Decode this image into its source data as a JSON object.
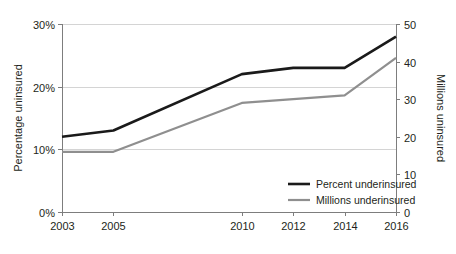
{
  "chart_data": {
    "type": "line",
    "title": "",
    "subtitle": "",
    "xlabel": "",
    "ylabel": "Percentage uninsured",
    "y2label": "Millions uninsured",
    "x": [
      2003,
      2005,
      2010,
      2012,
      2014,
      2016
    ],
    "categories": [
      "2003",
      "2005",
      "2010",
      "2012",
      "2014",
      "2016"
    ],
    "xlim": [
      2003,
      2016
    ],
    "ylim": [
      0,
      30
    ],
    "y2lim": [
      0,
      50
    ],
    "yticks": [
      0,
      10,
      20,
      30
    ],
    "ytick_labels": [
      "0%",
      "10%",
      "20%",
      "30%"
    ],
    "y2ticks": [
      0,
      10,
      20,
      30,
      40,
      50
    ],
    "y2tick_labels": [
      "0",
      "10",
      "20",
      "30",
      "40",
      "50"
    ],
    "grid": "horizontal",
    "legend_position": "inside-bottom-right",
    "series": [
      {
        "name": "Percent underinsured",
        "axis": "left",
        "unit": "%",
        "color": "#1a1a1a",
        "width": 2.6,
        "values": [
          12,
          13,
          22,
          23,
          23,
          28
        ]
      },
      {
        "name": "Millions underinsured",
        "axis": "right",
        "unit": "millions",
        "color": "#8f8f8f",
        "width": 2.2,
        "values": [
          16,
          16,
          29,
          30,
          31,
          41
        ]
      }
    ],
    "annotations": []
  },
  "legend": {
    "items": [
      {
        "label": "Percent underinsured",
        "swatch": "thick-black-line"
      },
      {
        "label": "Millions underinsured",
        "swatch": "thin-gray-line"
      }
    ]
  }
}
